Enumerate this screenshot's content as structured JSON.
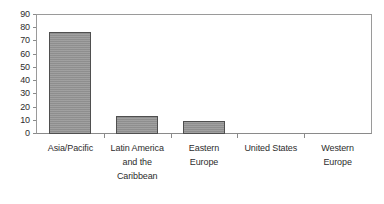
{
  "chart_data": {
    "type": "bar",
    "title": "",
    "xlabel": "",
    "ylabel": "",
    "categories": [
      "Asia/Pacific",
      "Latin America and the Caribbean",
      "Eastern Europe",
      "United States",
      "Western Europe"
    ],
    "category_lines": [
      [
        "Asia/Pacific"
      ],
      [
        "Latin America",
        "and the",
        "Caribbean"
      ],
      [
        "Eastern",
        "Europe"
      ],
      [
        "United States"
      ],
      [
        "Western",
        "Europe"
      ]
    ],
    "values": [
      77,
      14,
      10,
      0,
      0
    ],
    "ylim": [
      0,
      90
    ],
    "ytick_step": 10,
    "yticks": [
      90,
      80,
      70,
      60,
      50,
      40,
      30,
      20,
      10,
      0
    ],
    "grid": false,
    "legend": "none",
    "bar_fill_color": "#969696",
    "bar_border_color": "#4f4f4f",
    "axis_color": "#8a8a8a",
    "background_color": "#ffffff",
    "text_color": "#2d2d2d"
  }
}
